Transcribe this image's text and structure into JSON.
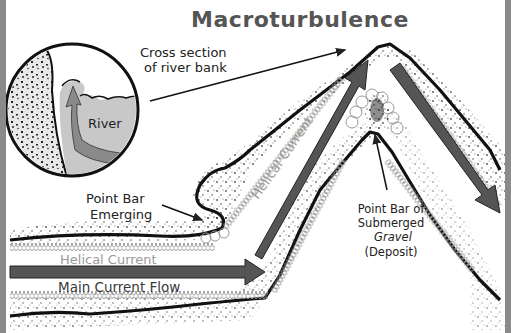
{
  "title": "Macroturbulence",
  "labels": {
    "cross_section_line1": "Cross section",
    "cross_section_line2": "of river bank",
    "river": "River",
    "point_bar_emerging_line1": "Point Bar",
    "point_bar_emerging_line2": "Emerging",
    "helical_current_horizontal": "Helical Current",
    "helical_current_diagonal": "Helical Current",
    "main_current_flow": "Main Current Flow",
    "point_bar_submerged_line1": "Point Bar of",
    "point_bar_submerged_line2": "Submerged",
    "point_bar_submerged_line3": "Gravel",
    "point_bar_submerged_line4": "(Deposit)"
  },
  "colors": {
    "frame": "#8a8a8a",
    "arrow": "#555555",
    "title": "#555555",
    "helical": "#9a9a9a",
    "river_water": "#c8c8c8",
    "river_arrow": "#8a8a8a"
  }
}
